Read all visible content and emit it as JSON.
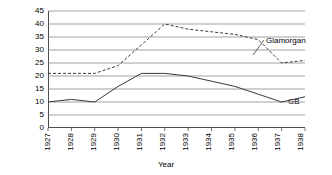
{
  "chart_data": {
    "type": "line",
    "title": "",
    "xlabel": "Year",
    "ylabel": "Percentage",
    "x": [
      1927,
      1928,
      1929,
      1930,
      1931,
      1932,
      1933,
      1934,
      1935,
      1936,
      1937,
      1938
    ],
    "categories": [
      "1927",
      "1928",
      "1929",
      "1930",
      "1931",
      "1932",
      "1933",
      "1934",
      "1935",
      "1936",
      "1937",
      "1938"
    ],
    "xlim": [
      1927,
      1938
    ],
    "ylim": [
      0,
      45
    ],
    "yticks": [
      0,
      5,
      10,
      15,
      20,
      25,
      30,
      35,
      40,
      45
    ],
    "ytick_labels": [
      "0",
      "5",
      "10",
      "15",
      "20",
      "25",
      "30",
      "35",
      "40",
      "45"
    ],
    "grid": "horizontal",
    "legend_position": "inline-annotation",
    "series": [
      {
        "name": "Glamorgan",
        "style": "dashed",
        "color": "#3a3a3a",
        "values": [
          21,
          21,
          21,
          24,
          32,
          40,
          38,
          37,
          36,
          34,
          25,
          26
        ]
      },
      {
        "name": "GB",
        "style": "solid",
        "color": "#3a3a3a",
        "values": [
          10,
          11,
          10,
          16,
          21,
          21,
          20,
          18,
          16,
          13,
          10,
          12
        ]
      }
    ],
    "annotations": [
      {
        "text": "Glamorgan",
        "series": "Glamorgan"
      },
      {
        "text": "GB",
        "series": "GB"
      }
    ]
  }
}
